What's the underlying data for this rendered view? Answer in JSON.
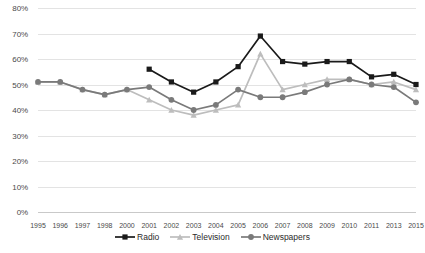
{
  "chart_data": {
    "type": "line",
    "title": "",
    "xlabel": "",
    "ylabel": "",
    "ylim": [
      0,
      80
    ],
    "ytick_step": 10,
    "grid": true,
    "legend_position": "bottom",
    "ytick_labels": [
      "0%",
      "10%",
      "20%",
      "30%",
      "40%",
      "50%",
      "60%",
      "70%",
      "80%"
    ],
    "categories": [
      "1995",
      "1996",
      "1997",
      "1998",
      "2000",
      "2001",
      "2002",
      "2003",
      "2004",
      "2005",
      "2006",
      "2007",
      "2008",
      "2009",
      "2010",
      "2011",
      "2013",
      "2015"
    ],
    "series": [
      {
        "name": "Radio",
        "color": "#1a1a1a",
        "marker": "square",
        "values": [
          null,
          null,
          null,
          null,
          null,
          56,
          51,
          47,
          51,
          57,
          69,
          59,
          58,
          59,
          59,
          53,
          54,
          50
        ]
      },
      {
        "name": "Television",
        "color": "#bdbdbd",
        "marker": "triangle",
        "values": [
          51,
          51,
          48,
          46,
          48,
          44,
          40,
          38,
          40,
          42,
          62,
          48,
          50,
          52,
          52,
          50,
          51,
          48
        ]
      },
      {
        "name": "Newspapers",
        "color": "#7a7a7a",
        "marker": "circle",
        "values": [
          51,
          51,
          48,
          46,
          48,
          49,
          44,
          40,
          42,
          48,
          45,
          45,
          47,
          50,
          52,
          50,
          49,
          43
        ]
      }
    ]
  },
  "legend": {
    "items": [
      {
        "label": "Radio"
      },
      {
        "label": "Television"
      },
      {
        "label": "Newspapers"
      }
    ]
  }
}
